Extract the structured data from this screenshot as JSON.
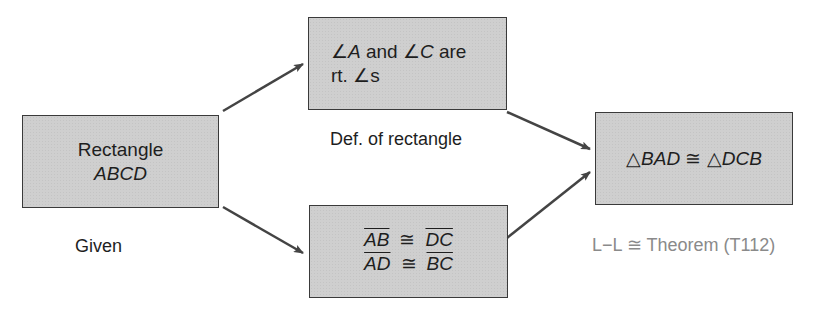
{
  "diagram": {
    "type": "flow-proof",
    "nodes": [
      {
        "id": "given",
        "line1": "Rectangle",
        "line2": "ABCD",
        "reason": "Given"
      },
      {
        "id": "right-angles",
        "angle_sym": "∠",
        "a": "A",
        "and": " and ",
        "c": "C",
        "are": " are",
        "line2_prefix": "rt. ",
        "line2_suffix": "s",
        "reason": "Def. of rectangle"
      },
      {
        "id": "congruent-segments",
        "seg1": "AB",
        "seg2": "DC",
        "seg3": "AD",
        "seg4": "BC",
        "cong": "≅",
        "reason": ""
      },
      {
        "id": "congruent-triangles",
        "tri": "△",
        "t1": "BAD",
        "cong": "≅",
        "t2": "DCB",
        "reason": "L−L ≅ Theorem (T112)"
      }
    ],
    "edges": [
      {
        "from": "given",
        "to": "right-angles"
      },
      {
        "from": "given",
        "to": "congruent-segments"
      },
      {
        "from": "right-angles",
        "to": "congruent-triangles"
      },
      {
        "from": "congruent-segments",
        "to": "congruent-triangles"
      }
    ],
    "colors": {
      "box_fill": "#cfcfcf",
      "box_border": "#3a3a3a",
      "arrow": "#444444",
      "text": "#1e1e1e",
      "theorem_text": "#8a8a8a"
    }
  }
}
